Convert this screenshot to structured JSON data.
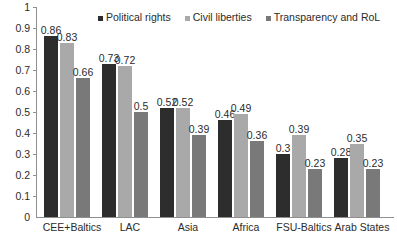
{
  "chart_data": {
    "type": "bar",
    "title": "",
    "xlabel": "",
    "ylabel": "",
    "ylim": [
      0,
      1
    ],
    "ytick_labels": [
      "1",
      "0.9",
      "0.8",
      "0.7",
      "0.6",
      "0.5",
      "0.4",
      "0.3",
      "0.2",
      "0.1",
      "0"
    ],
    "ytick_values": [
      1,
      0.9,
      0.8,
      0.7,
      0.6,
      0.5,
      0.4,
      0.3,
      0.2,
      0.1,
      0
    ],
    "grid": false,
    "legend_position": "top",
    "categories": [
      "CEE+Baltics",
      "LAC",
      "Asia",
      "Africa",
      "FSU-Baltics",
      "Arab States"
    ],
    "series": [
      {
        "name": "Political rights",
        "color": "#2d2d2d",
        "values": [
          0.86,
          0.73,
          0.52,
          0.46,
          0.3,
          0.28
        ],
        "labels": [
          "0.86",
          "0.73",
          "0.52",
          "0.46",
          "0.3",
          "0.28"
        ]
      },
      {
        "name": "Civil liberties",
        "color": "#a9a9a9",
        "values": [
          0.83,
          0.72,
          0.52,
          0.49,
          0.39,
          0.35
        ],
        "labels": [
          "0.83",
          "0.72",
          "0.52",
          "0.49",
          "0.39",
          "0.35"
        ]
      },
      {
        "name": "Transparency and RoL",
        "color": "#797979",
        "values": [
          0.66,
          0.5,
          0.39,
          0.36,
          0.23,
          0.23
        ],
        "labels": [
          "0.66",
          "0.5",
          "0.39",
          "0.36",
          "0.23",
          "0.23"
        ]
      }
    ]
  },
  "legend": {
    "items": [
      {
        "label": "Political rights",
        "color": "#2d2d2d"
      },
      {
        "label": "Civil liberties",
        "color": "#a9a9a9"
      },
      {
        "label": "Transparency and RoL",
        "color": "#797979"
      }
    ]
  },
  "axis": {
    "y_max_label": "1",
    "y_min_label": "0"
  }
}
